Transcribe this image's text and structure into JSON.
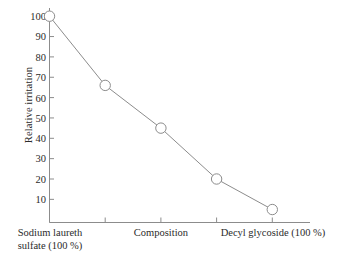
{
  "chart_data": {
    "type": "line",
    "title": "",
    "xlabel": "",
    "ylabel": "Relative irritation",
    "categories": [
      "Sodium laureth sulfate (100 %)",
      "",
      "Composition",
      "",
      "Decyl glycoside (100 %)"
    ],
    "x": [
      1,
      2,
      3,
      4,
      5
    ],
    "values": [
      100,
      66,
      45,
      20,
      5
    ],
    "ylim": [
      0,
      100
    ],
    "xlim": [
      0.5,
      5.5
    ],
    "yticks": [
      10,
      20,
      30,
      40,
      50,
      60,
      70,
      80,
      90,
      100
    ],
    "ytick_labels": [
      "10",
      "20",
      "30",
      "40",
      "50",
      "60",
      "70",
      "80",
      "90",
      "100"
    ],
    "xtick_positions": [
      1,
      2,
      3,
      4,
      5
    ],
    "grid": false,
    "legend": null,
    "marker": "open-circle",
    "series": [
      {
        "name": "Relative irritation",
        "values": [
          100,
          66,
          45,
          20,
          5
        ]
      }
    ]
  },
  "axes": {
    "y_title": "Relative irritation",
    "y_ticks": [
      "100",
      "90",
      "80",
      "70",
      "60",
      "50",
      "40",
      "30",
      "20",
      "10"
    ],
    "x_labels": {
      "left": "Sodium laureth\nsulfate (100 %)",
      "middle": "Composition",
      "right": "Decyl glycoside (100 %)"
    }
  },
  "colors": {
    "background": "#ffffff",
    "axis": "#8c8c8c",
    "line": "#8c8c8c",
    "marker_stroke": "#8c8c8c",
    "marker_fill": "#ffffff",
    "text": "#2b2b2b"
  }
}
